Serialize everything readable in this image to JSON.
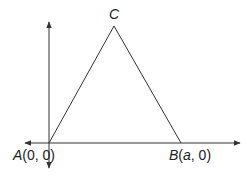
{
  "diagram": {
    "type": "coordinate-geometry-triangle",
    "colors": {
      "stroke": "#333333",
      "background": "#ffffff",
      "text": "#222222"
    },
    "axes": {
      "origin": {
        "x": 49,
        "y": 143
      },
      "x_axis": {
        "from": 25,
        "to": 240,
        "arrows": "both"
      },
      "y_axis": {
        "from": 22,
        "to": 168,
        "arrows": "both"
      }
    },
    "vertices": {
      "A": {
        "name": "A",
        "coords": "(0, 0)",
        "px": [
          49,
          143
        ]
      },
      "B": {
        "name": "B",
        "coords_prefix": "(",
        "coords_var": "a",
        "coords_suffix": ", 0)",
        "px": [
          181,
          143
        ]
      },
      "C": {
        "name": "C",
        "px": [
          114,
          26
        ]
      }
    },
    "labels": {
      "A_name": "A",
      "A_coords": "(0, 0)",
      "B_name": "B",
      "B_open": "(",
      "B_var": "a",
      "B_rest": ", 0)",
      "C_name": "C"
    }
  }
}
